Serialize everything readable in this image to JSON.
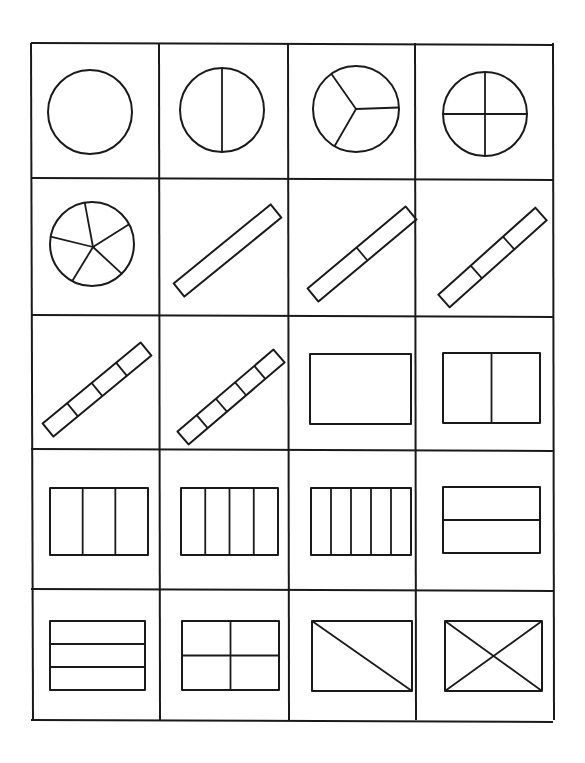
{
  "diagram": {
    "title": "",
    "grid": {
      "columns": 4,
      "rows": 5,
      "col_x": [
        31,
        159,
        288,
        415,
        553
      ],
      "row_y": [
        43,
        178,
        315,
        449,
        589,
        720
      ]
    },
    "colors": {
      "line": "#1a1a1a",
      "background": "#ffffff"
    },
    "cells": [
      {
        "row": 0,
        "col": 0,
        "shape": "circle",
        "parts": 1,
        "cx": 90,
        "cy": 112,
        "r": 42
      },
      {
        "row": 0,
        "col": 1,
        "shape": "circle",
        "parts": 2,
        "cx": 222,
        "cy": 110,
        "r": 42
      },
      {
        "row": 0,
        "col": 2,
        "shape": "circle",
        "parts": 3,
        "cx": 356,
        "cy": 109,
        "r": 43
      },
      {
        "row": 0,
        "col": 3,
        "shape": "circle",
        "parts": 4,
        "cx": 485,
        "cy": 114,
        "r": 42
      },
      {
        "row": 1,
        "col": 0,
        "shape": "circle",
        "parts": 5,
        "cx": 92,
        "cy": 244,
        "r": 42
      },
      {
        "row": 1,
        "col": 1,
        "shape": "diagonal-bar",
        "parts": 1,
        "x1": 179,
        "y1": 290,
        "x2": 276,
        "y2": 211,
        "w": 17
      },
      {
        "row": 1,
        "col": 2,
        "shape": "diagonal-bar",
        "parts": 2,
        "x1": 313,
        "y1": 295,
        "x2": 411,
        "y2": 213,
        "w": 17
      },
      {
        "row": 1,
        "col": 3,
        "shape": "diagonal-bar",
        "parts": 3,
        "x1": 444,
        "y1": 301,
        "x2": 541,
        "y2": 214,
        "w": 17
      },
      {
        "row": 2,
        "col": 0,
        "shape": "diagonal-bar",
        "parts": 4,
        "x1": 48,
        "y1": 430,
        "x2": 146,
        "y2": 349,
        "w": 17
      },
      {
        "row": 2,
        "col": 1,
        "shape": "diagonal-bar",
        "parts": 5,
        "x1": 183,
        "y1": 438,
        "x2": 279,
        "y2": 356,
        "w": 17
      },
      {
        "row": 2,
        "col": 2,
        "shape": "rectangle",
        "divide": "none",
        "parts": 1,
        "x": 310,
        "y": 354,
        "w": 101,
        "h": 70
      },
      {
        "row": 2,
        "col": 3,
        "shape": "rectangle",
        "divide": "vertical",
        "parts": 2,
        "x": 443,
        "y": 353,
        "w": 97,
        "h": 70
      },
      {
        "row": 3,
        "col": 0,
        "shape": "rectangle",
        "divide": "vertical",
        "parts": 3,
        "x": 50,
        "y": 488,
        "w": 98,
        "h": 67
      },
      {
        "row": 3,
        "col": 1,
        "shape": "rectangle",
        "divide": "vertical",
        "parts": 4,
        "x": 181,
        "y": 488,
        "w": 97,
        "h": 67
      },
      {
        "row": 3,
        "col": 2,
        "shape": "rectangle",
        "divide": "vertical",
        "parts": 5,
        "x": 311,
        "y": 488,
        "w": 100,
        "h": 67
      },
      {
        "row": 3,
        "col": 3,
        "shape": "rectangle",
        "divide": "horizontal",
        "parts": 2,
        "x": 443,
        "y": 487,
        "w": 97,
        "h": 66
      },
      {
        "row": 4,
        "col": 0,
        "shape": "rectangle",
        "divide": "horizontal",
        "parts": 3,
        "x": 50,
        "y": 621,
        "w": 95,
        "h": 69
      },
      {
        "row": 4,
        "col": 1,
        "shape": "rectangle",
        "divide": "quarters",
        "parts": 4,
        "x": 182,
        "y": 621,
        "w": 97,
        "h": 69
      },
      {
        "row": 4,
        "col": 2,
        "shape": "rectangle",
        "divide": "one-diagonal",
        "parts": 2,
        "x": 312,
        "y": 621,
        "w": 100,
        "h": 70
      },
      {
        "row": 4,
        "col": 3,
        "shape": "rectangle",
        "divide": "two-diagonals",
        "parts": 4,
        "x": 445,
        "y": 621,
        "w": 97,
        "h": 70
      }
    ]
  }
}
